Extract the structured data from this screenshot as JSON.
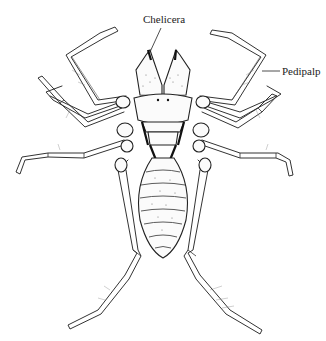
{
  "figure": {
    "labels": [
      {
        "id": "chelicera",
        "text": "Chelicera"
      },
      {
        "id": "pedipalp",
        "text": "Pedipalp"
      }
    ]
  },
  "colors": {
    "ink": "#222222",
    "background": "#ffffff"
  }
}
